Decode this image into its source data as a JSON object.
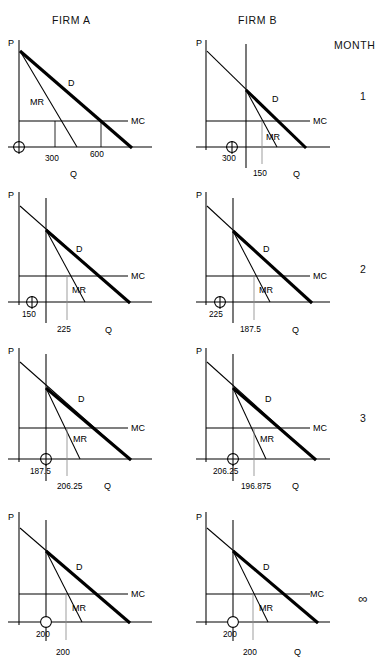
{
  "header": {
    "firm_a": "FIRM A",
    "firm_b": "FIRM B",
    "month": "MONTH"
  },
  "axis_labels": {
    "price": "P",
    "quantity": "Q",
    "demand": "D",
    "marginal_revenue": "MR",
    "marginal_cost": "MC"
  },
  "months": [
    {
      "label": "1"
    },
    {
      "label": "2"
    },
    {
      "label": "3"
    },
    {
      "label": "∞"
    }
  ],
  "panels": [
    {
      "month": "1",
      "firm": "FIRM A",
      "p_label": "P",
      "q_label": "Q",
      "d_label": "D",
      "mr_label": "MR",
      "mc_label": "MC",
      "kink_quantity": "",
      "mr_quantity": "300",
      "d_quantity": "600",
      "has_kink_line": false
    },
    {
      "month": "1",
      "firm": "FIRM B",
      "p_label": "P",
      "q_label": "Q",
      "d_label": "D",
      "mr_label": "MR",
      "mc_label": "MC",
      "kink_quantity": "300",
      "mr_quantity": "150",
      "d_quantity": "",
      "has_kink_line": true
    },
    {
      "month": "2",
      "firm": "FIRM A",
      "p_label": "P",
      "q_label": "Q",
      "d_label": "D",
      "mr_label": "MR",
      "mc_label": "MC",
      "kink_quantity": "150",
      "mr_quantity": "225",
      "d_quantity": "",
      "has_kink_line": true
    },
    {
      "month": "2",
      "firm": "FIRM B",
      "p_label": "P",
      "q_label": "Q",
      "d_label": "D",
      "mr_label": "MR",
      "mc_label": "MC",
      "kink_quantity": "225",
      "mr_quantity": "187.5",
      "d_quantity": "",
      "has_kink_line": true
    },
    {
      "month": "3",
      "firm": "FIRM A",
      "p_label": "P",
      "q_label": "Q",
      "d_label": "D",
      "mr_label": "MR",
      "mc_label": "MC",
      "kink_quantity": "187.5",
      "mr_quantity": "206.25",
      "d_quantity": "",
      "has_kink_line": true
    },
    {
      "month": "3",
      "firm": "FIRM B",
      "p_label": "P",
      "q_label": "Q",
      "d_label": "D",
      "mr_label": "MR",
      "mc_label": "MC",
      "kink_quantity": "206.25",
      "mr_quantity": "196.875",
      "d_quantity": "",
      "has_kink_line": true
    },
    {
      "month": "∞",
      "firm": "FIRM A",
      "p_label": "P",
      "q_label": "Q",
      "d_label": "D",
      "mr_label": "MR",
      "mc_label": "MC",
      "kink_quantity": "200",
      "mr_quantity": "200",
      "d_quantity": "",
      "has_kink_line": true
    },
    {
      "month": "∞",
      "firm": "FIRM B",
      "p_label": "P",
      "q_label": "Q",
      "d_label": "D",
      "mr_label": "MR",
      "mc_label": "MC",
      "kink_quantity": "200",
      "mr_quantity": "200",
      "d_quantity": "",
      "has_kink_line": true
    }
  ],
  "colors": {
    "ink": "#000000",
    "gray_tick": "#8d8d8d",
    "background": "#ffffff"
  }
}
